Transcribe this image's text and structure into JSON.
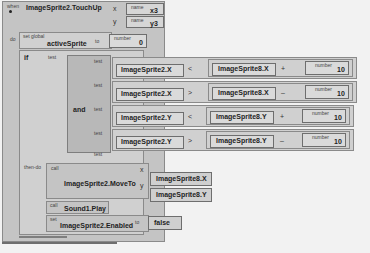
{
  "event_block": {
    "keyword": "when",
    "event_name": "ImageSprite2.TouchUp",
    "params": [
      {
        "arrow": "x",
        "label": "name",
        "value": "x3"
      },
      {
        "arrow": "y",
        "label": "name",
        "value": "y3"
      }
    ],
    "do_label": "do"
  },
  "set_global": {
    "keyword": "set global",
    "variable": "activeSprite",
    "to_label": "to",
    "number_label": "number",
    "number_value": "0"
  },
  "if_block": {
    "keyword": "if",
    "test_label": "test",
    "and_label": "and",
    "then_label": "then-do",
    "conditions": [
      {
        "test_label": "test",
        "left": "ImageSprite2.X",
        "op": "<",
        "right": "ImageSprite8.X",
        "math_op": "+",
        "number_label": "number",
        "number": "10"
      },
      {
        "test_label": "test",
        "left": "ImageSprite2.X",
        "op": ">",
        "right": "ImageSprite8.X",
        "math_op": "–",
        "number_label": "number",
        "number": "10"
      },
      {
        "test_label": "test",
        "left": "ImageSprite2.Y",
        "op": "<",
        "right": "ImageSprite8.Y",
        "math_op": "+",
        "number_label": "number",
        "number": "10"
      },
      {
        "test_label": "test",
        "left": "ImageSprite2.Y",
        "op": ">",
        "right": "ImageSprite8.Y",
        "math_op": "–",
        "number_label": "number",
        "number": "10"
      }
    ],
    "empty_test_label": "test"
  },
  "then_blocks": {
    "moveto": {
      "keyword": "call",
      "name": "ImageSprite2.MoveTo",
      "arg_x_label": "x",
      "arg_x": "ImageSprite8.X",
      "arg_y_label": "y",
      "arg_y": "ImageSprite8.Y"
    },
    "play": {
      "keyword": "call",
      "name": "Sound1.Play"
    },
    "enabled": {
      "keyword": "set",
      "name": "ImageSprite2.Enabled",
      "to_label": "to",
      "value": "false"
    }
  }
}
